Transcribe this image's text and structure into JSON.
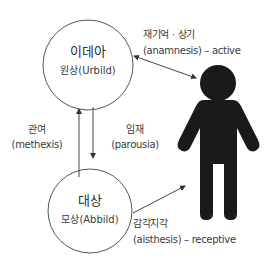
{
  "diagram": {
    "idea": {
      "title": "이데아",
      "subtitle": "원상(Urbild)"
    },
    "object": {
      "title": "대상",
      "subtitle": "모상(Abbild)"
    },
    "methexis": {
      "line1": "관여",
      "line2": "(methexis)"
    },
    "parousia": {
      "line1": "임재",
      "line2": "(parousia)"
    },
    "anamnesis": {
      "line1": "재기억 · 상기",
      "line2": "(anamnesis) – active"
    },
    "aisthesis": {
      "line1": "감각지각",
      "line2": "(aisthesis) – receptive"
    },
    "icons": [
      "person-icon",
      "double-arrow",
      "up-arrow",
      "down-arrow",
      "single-arrow"
    ],
    "colors": {
      "line": "#444444",
      "figure": "#1a1a1a",
      "background": "#ffffff"
    }
  }
}
